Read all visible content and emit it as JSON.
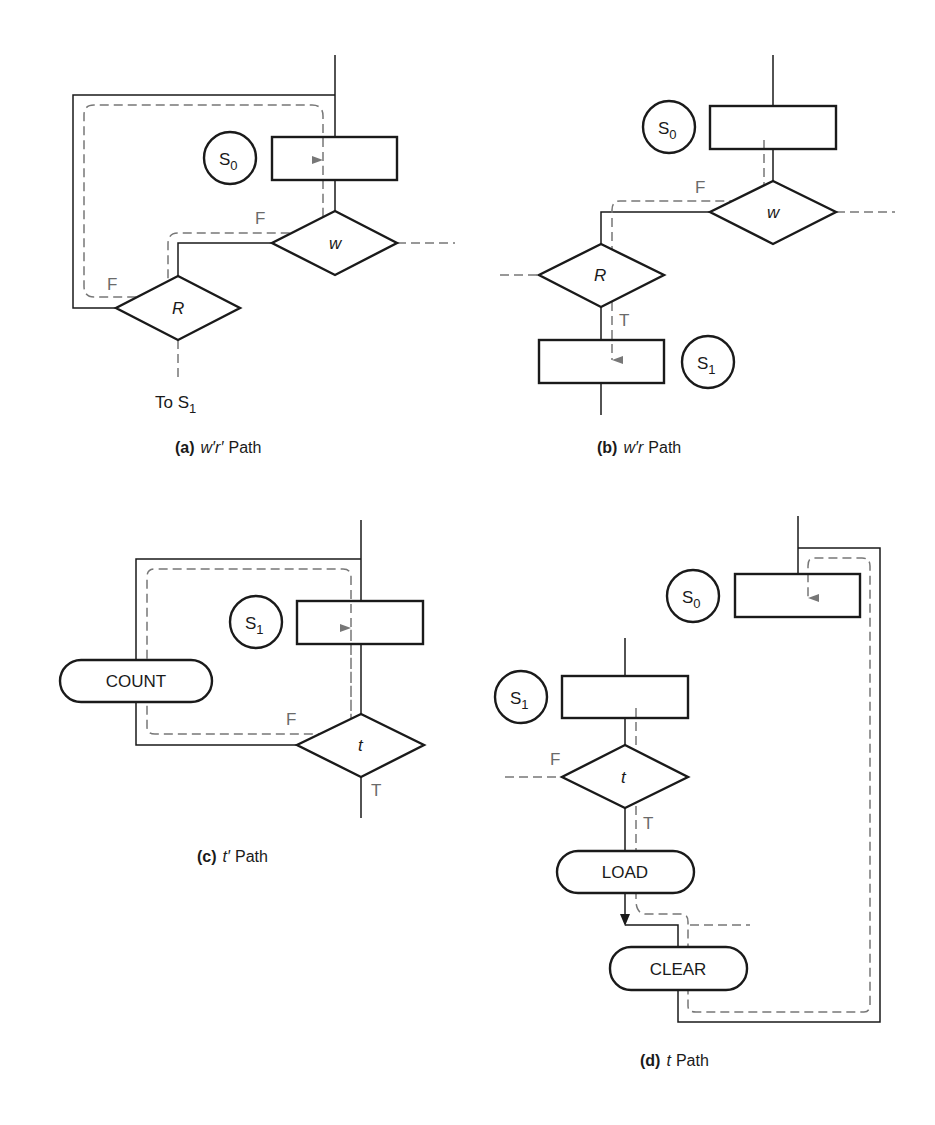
{
  "colors": {
    "line": "#1a1a1a",
    "path_highlight": "#777777",
    "branch_label": "#6a6a6a",
    "background": "#ffffff"
  },
  "diagrams": {
    "a": {
      "caption_letter": "(a)",
      "caption_var": "w′r′",
      "caption_word": "Path",
      "state": "S",
      "state_sub": "0",
      "decision1": "w",
      "decision2": "R",
      "branch1": "F",
      "branch2": "F",
      "exit_label": "To S",
      "exit_sub": "1"
    },
    "b": {
      "caption_letter": "(b)",
      "caption_var": "w′r",
      "caption_word": "Path",
      "state_top": "S",
      "state_top_sub": "0",
      "state_bottom": "S",
      "state_bottom_sub": "1",
      "decision1": "w",
      "decision2": "R",
      "branch1": "F",
      "branch2": "T"
    },
    "c": {
      "caption_letter": "(c)",
      "caption_var": "t′",
      "caption_word": "Path",
      "state": "S",
      "state_sub": "1",
      "decision": "t",
      "action": "COUNT",
      "branch_false": "F",
      "branch_true": "T"
    },
    "d": {
      "caption_letter": "(d)",
      "caption_var": "t",
      "caption_word": "Path",
      "state_top": "S",
      "state_top_sub": "0",
      "state_bottom": "S",
      "state_bottom_sub": "1",
      "decision": "t",
      "action1": "LOAD",
      "action2": "CLEAR",
      "branch_false": "F",
      "branch_true": "T"
    }
  }
}
